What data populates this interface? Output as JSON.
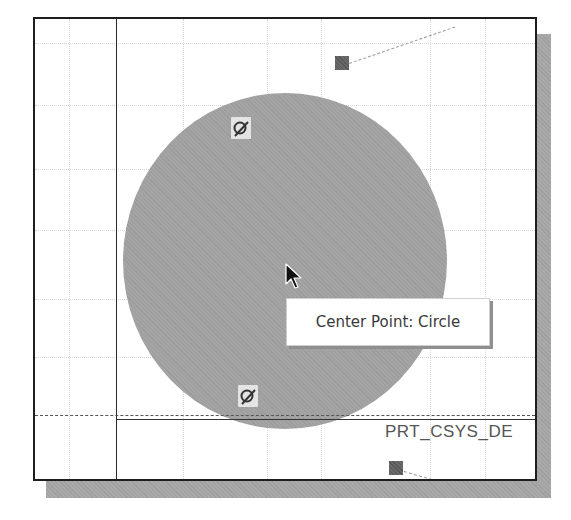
{
  "viewport": {
    "background": "#ffffff",
    "border_color": "#1e1e1e",
    "shadow_color": "#a9a9a9"
  },
  "sketch": {
    "circle": {
      "fill": "#a4a4a4",
      "center_px": [
        285,
        260
      ],
      "radius_px": 162
    },
    "markers": [
      {
        "name": "top-marker",
        "color": "#6a6a6a"
      },
      {
        "name": "bottom-marker",
        "color": "#6a6a6a"
      }
    ],
    "constraint_icons": [
      {
        "name": "tangent-constraint-icon-top",
        "symbol": "tangent"
      },
      {
        "name": "tangent-constraint-icon-bottom",
        "symbol": "tangent"
      }
    ],
    "csys_label": "PRT_CSYS_DE"
  },
  "tooltip": {
    "text": "Center Point: Circle"
  },
  "cursor": {
    "icon": "arrow-pointer-icon"
  }
}
